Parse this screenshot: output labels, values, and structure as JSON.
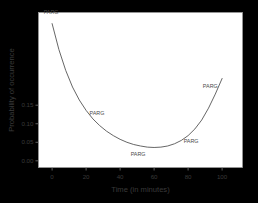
{
  "chart_data": {
    "type": "line",
    "title": "",
    "xlabel": "Time (in minutes)",
    "ylabel": "Probability of occurrence",
    "xlim": [
      -8,
      112
    ],
    "ylim": [
      -0.018,
      0.4
    ],
    "xticks": [
      0,
      20,
      40,
      60,
      80,
      100
    ],
    "xtick_labels": [
      "0",
      "20",
      "40",
      "60",
      "80",
      "100"
    ],
    "yticks": [
      0.0,
      0.05,
      0.1,
      0.15
    ],
    "ytick_labels": [
      "0.00",
      "0.05",
      "0.10",
      "0.15"
    ],
    "grid": false,
    "legend": null,
    "series": [
      {
        "name": "PARG",
        "color": "#555555",
        "x": [
          0,
          4,
          8,
          12,
          16,
          20,
          24,
          28,
          32,
          36,
          40,
          44,
          48,
          52,
          56,
          60,
          64,
          68,
          72,
          76,
          80,
          84,
          88,
          92,
          96,
          100
        ],
        "y": [
          0.37,
          0.3,
          0.244,
          0.199,
          0.164,
          0.136,
          0.113,
          0.095,
          0.08,
          0.068,
          0.058,
          0.05,
          0.044,
          0.04,
          0.037,
          0.036,
          0.037,
          0.04,
          0.046,
          0.055,
          0.068,
          0.086,
          0.11,
          0.142,
          0.18,
          0.222
        ]
      }
    ],
    "annotations": [
      {
        "text": "PARG",
        "x": 0,
        "y": 0.372,
        "dx": -1,
        "dy": -9
      },
      {
        "text": "PARG",
        "x": 24,
        "y": 0.113,
        "dx": 4,
        "dy": -4
      },
      {
        "text": "PARG",
        "x": 50,
        "y": 0.041,
        "dx": 1,
        "dy": 10
      },
      {
        "text": "PARG",
        "x": 80,
        "y": 0.068,
        "dx": 3,
        "dy": 7
      },
      {
        "text": "PARG",
        "x": 96,
        "y": 0.18,
        "dx": -5,
        "dy": -6
      }
    ]
  },
  "style": {
    "figure_background": "#e9e9e9",
    "axes_background": "#ffffff",
    "frame_color": "#9a9a9a",
    "curve_color": "#555555",
    "tick_color": "#7a7a7a",
    "text_color": "#3a3a3a"
  }
}
